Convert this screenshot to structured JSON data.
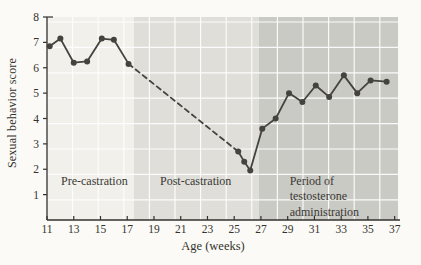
{
  "chart_data": {
    "type": "line",
    "title": "",
    "xlabel": "Age (weeks)",
    "ylabel": "Sexual behavior score",
    "xlim": [
      11,
      37.25
    ],
    "ylim": [
      0,
      8
    ],
    "x_ticks": [
      11,
      13,
      15,
      17,
      19,
      21,
      23,
      25,
      27,
      29,
      31,
      33,
      35,
      37
    ],
    "y_ticks": [
      1,
      2,
      3,
      4,
      5,
      6,
      7,
      8
    ],
    "grid": true,
    "grid_color": "#ffffff",
    "line_color": "#44433e",
    "axis_color": "#33322d",
    "regions": [
      {
        "name": "pre-castration",
        "label_lines": [
          "Pre-castration"
        ],
        "x_start": 11,
        "x_end": 17.5,
        "color": "#f1f0eb",
        "label_x": 12.05,
        "label_y": 1.38
      },
      {
        "name": "post-castration",
        "label_lines": [
          "Post-castration"
        ],
        "x_start": 17.5,
        "x_end": 26.85,
        "color": "#dfded9",
        "label_x": 19.45,
        "label_y": 1.38
      },
      {
        "name": "testosterone-administration",
        "label_lines": [
          "Period of",
          "testosterone",
          "administration"
        ],
        "x_start": 26.85,
        "x_end": 37.25,
        "color": "#cacac5",
        "label_x": 29.15,
        "label_y": 1.38
      }
    ],
    "series": [
      {
        "name": "pre-castration scores",
        "style": "solid",
        "markers": true,
        "points": [
          [
            11.2,
            6.85
          ],
          [
            12,
            7.15
          ],
          [
            13,
            6.2
          ],
          [
            14,
            6.25
          ],
          [
            15.1,
            7.15
          ],
          [
            16,
            7.1
          ],
          [
            17.1,
            6.15
          ]
        ]
      },
      {
        "name": "post-castration decline (interpolated)",
        "style": "dashed",
        "markers": false,
        "points": [
          [
            17.1,
            6.15
          ],
          [
            25.3,
            2.7
          ]
        ]
      },
      {
        "name": "post-castration low and testosterone recovery scores",
        "style": "solid",
        "markers": true,
        "points": [
          [
            25.3,
            2.7
          ],
          [
            25.75,
            2.3
          ],
          [
            26.2,
            1.95
          ],
          [
            27.1,
            3.6
          ],
          [
            28.1,
            4.0
          ],
          [
            29.1,
            5.0
          ],
          [
            30.1,
            4.65
          ],
          [
            31.1,
            5.3
          ],
          [
            32.1,
            4.85
          ],
          [
            33.2,
            5.7
          ],
          [
            34.2,
            5.0
          ],
          [
            35.2,
            5.5
          ],
          [
            36.4,
            5.45
          ]
        ]
      }
    ]
  }
}
